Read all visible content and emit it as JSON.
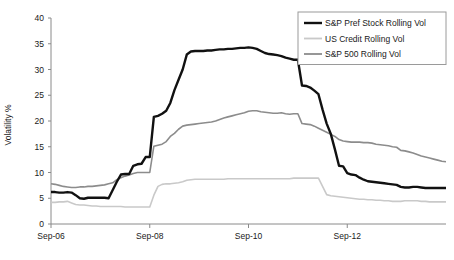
{
  "chart_data": {
    "type": "line",
    "title": "",
    "subtitle": "",
    "xlabel": "",
    "ylabel": "Volatility %",
    "ylim": [
      0,
      40
    ],
    "yticks": [
      0,
      5,
      10,
      15,
      20,
      25,
      30,
      35,
      40
    ],
    "ytick_labels": [
      "0",
      "5",
      "10",
      "15",
      "20",
      "25",
      "30",
      "35",
      "40"
    ],
    "xtick_labels": [
      "Sep-06",
      "Sep-08",
      "Sep-10",
      "Sep-12"
    ],
    "xtick_positions": [
      0,
      24,
      48,
      72
    ],
    "xlim": [
      0,
      96
    ],
    "x_unit": "months since Sep-06",
    "grid": false,
    "legend_position": "top-right",
    "colors": {
      "sp_pref_stock": "#111111",
      "us_credit": "#c9c9c9",
      "sp_500": "#8c8c8c",
      "axis": "#8a8a8a",
      "text": "#1a1a1a",
      "background": "#ffffff"
    },
    "series": [
      {
        "name": "S&P Pref Stock Rolling Vol",
        "color": "#111111",
        "width": 2.4,
        "x": [
          0,
          1,
          2,
          3,
          4,
          5,
          6,
          7,
          8,
          9,
          10,
          11,
          12,
          13,
          14,
          15,
          16,
          17,
          18,
          19,
          20,
          21,
          22,
          23,
          24,
          25,
          26,
          27,
          28,
          29,
          30,
          31,
          32,
          33,
          34,
          35,
          36,
          37,
          38,
          39,
          40,
          41,
          42,
          43,
          44,
          45,
          46,
          47,
          48,
          49,
          50,
          51,
          52,
          53,
          54,
          55,
          56,
          57,
          58,
          59,
          60,
          61,
          62,
          63,
          64,
          65,
          66,
          67,
          68,
          69,
          70,
          71,
          72,
          73,
          74,
          75,
          76,
          77,
          78,
          79,
          80,
          81,
          82,
          83,
          84,
          85,
          86,
          87,
          88,
          89,
          90,
          91,
          92,
          93,
          94,
          95,
          96
        ],
        "values": [
          6.2,
          6.2,
          6.1,
          6.1,
          6.2,
          6.1,
          5.6,
          5.0,
          4.9,
          5.1,
          5.1,
          5.1,
          5.1,
          5.1,
          5.0,
          6.6,
          8.2,
          9.6,
          9.7,
          9.7,
          11.3,
          11.6,
          11.7,
          13.0,
          13.0,
          20.8,
          21.0,
          21.4,
          22.0,
          23.5,
          26.0,
          28.0,
          30.0,
          32.9,
          33.5,
          33.6,
          33.6,
          33.6,
          33.7,
          33.7,
          33.8,
          33.9,
          33.9,
          34.0,
          34.0,
          34.1,
          34.2,
          34.2,
          34.3,
          34.2,
          34.0,
          33.6,
          33.2,
          33.0,
          32.9,
          32.8,
          32.6,
          32.3,
          32.1,
          31.9,
          31.9,
          26.9,
          26.8,
          26.5,
          25.9,
          25.2,
          22.2,
          19.5,
          17.5,
          14.5,
          11.3,
          11.2,
          9.9,
          9.6,
          9.5,
          9.0,
          8.6,
          8.3,
          8.2,
          8.1,
          8.0,
          7.9,
          7.8,
          7.7,
          7.6,
          7.2,
          7.1,
          7.1,
          7.2,
          7.2,
          7.1,
          7.0,
          7.0,
          7.0,
          7.0,
          7.0,
          7.0
        ]
      },
      {
        "name": "US Credit Rolling Vol",
        "color": "#c9c9c9",
        "width": 1.6,
        "x": [
          0,
          1,
          2,
          3,
          4,
          5,
          6,
          7,
          8,
          9,
          10,
          11,
          12,
          13,
          14,
          15,
          16,
          17,
          18,
          19,
          20,
          21,
          22,
          23,
          24,
          25,
          26,
          27,
          28,
          29,
          30,
          31,
          32,
          33,
          34,
          35,
          36,
          37,
          38,
          39,
          40,
          41,
          42,
          43,
          44,
          45,
          46,
          47,
          48,
          49,
          50,
          51,
          52,
          53,
          54,
          55,
          56,
          57,
          58,
          59,
          60,
          61,
          62,
          63,
          64,
          65,
          66,
          67,
          68,
          69,
          70,
          71,
          72,
          73,
          74,
          75,
          76,
          77,
          78,
          79,
          80,
          81,
          82,
          83,
          84,
          85,
          86,
          87,
          88,
          89,
          90,
          91,
          92,
          93,
          94,
          95,
          96
        ],
        "values": [
          4.2,
          4.2,
          4.3,
          4.3,
          4.4,
          4.1,
          3.8,
          3.7,
          3.7,
          3.6,
          3.5,
          3.5,
          3.4,
          3.4,
          3.4,
          3.4,
          3.4,
          3.4,
          3.3,
          3.3,
          3.3,
          3.3,
          3.3,
          3.3,
          3.3,
          5.6,
          7.3,
          7.7,
          7.8,
          7.8,
          7.9,
          8.0,
          8.2,
          8.5,
          8.6,
          8.7,
          8.7,
          8.7,
          8.7,
          8.7,
          8.7,
          8.7,
          8.7,
          8.8,
          8.8,
          8.8,
          8.8,
          8.8,
          8.8,
          8.8,
          8.8,
          8.8,
          8.8,
          8.8,
          8.8,
          8.8,
          8.8,
          8.8,
          8.8,
          8.9,
          8.9,
          8.9,
          8.9,
          8.9,
          8.9,
          8.9,
          7.3,
          5.7,
          5.5,
          5.4,
          5.3,
          5.2,
          5.1,
          5.0,
          4.9,
          4.8,
          4.8,
          4.7,
          4.7,
          4.6,
          4.6,
          4.5,
          4.5,
          4.4,
          4.4,
          4.4,
          4.5,
          4.5,
          4.5,
          4.5,
          4.4,
          4.4,
          4.3,
          4.3,
          4.3,
          4.3,
          4.3
        ]
      },
      {
        "name": "S&P 500 Rolling Vol",
        "color": "#8c8c8c",
        "width": 1.6,
        "x": [
          0,
          1,
          2,
          3,
          4,
          5,
          6,
          7,
          8,
          9,
          10,
          11,
          12,
          13,
          14,
          15,
          16,
          17,
          18,
          19,
          20,
          21,
          22,
          23,
          24,
          25,
          26,
          27,
          28,
          29,
          30,
          31,
          32,
          33,
          34,
          35,
          36,
          37,
          38,
          39,
          40,
          41,
          42,
          43,
          44,
          45,
          46,
          47,
          48,
          49,
          50,
          51,
          52,
          53,
          54,
          55,
          56,
          57,
          58,
          59,
          60,
          61,
          62,
          63,
          64,
          65,
          66,
          67,
          68,
          69,
          70,
          71,
          72,
          73,
          74,
          75,
          76,
          77,
          78,
          79,
          80,
          81,
          82,
          83,
          84,
          85,
          86,
          87,
          88,
          89,
          90,
          91,
          92,
          93,
          94,
          95,
          96
        ],
        "values": [
          7.8,
          7.7,
          7.5,
          7.3,
          7.2,
          7.1,
          7.1,
          7.2,
          7.2,
          7.3,
          7.3,
          7.4,
          7.5,
          7.6,
          7.8,
          8.0,
          8.6,
          9.0,
          9.3,
          9.5,
          9.8,
          10.0,
          10.0,
          10.0,
          10.0,
          15.1,
          15.3,
          15.5,
          16.0,
          17.0,
          17.6,
          18.4,
          19.0,
          19.2,
          19.3,
          19.4,
          19.5,
          19.6,
          19.7,
          19.8,
          20.0,
          20.3,
          20.6,
          20.8,
          21.0,
          21.2,
          21.4,
          21.6,
          21.9,
          22.0,
          22.0,
          21.8,
          21.7,
          21.6,
          21.5,
          21.5,
          21.6,
          21.4,
          21.3,
          21.4,
          21.4,
          19.5,
          19.4,
          19.3,
          19.0,
          18.6,
          18.2,
          17.8,
          17.4,
          17.0,
          16.4,
          16.1,
          16.0,
          15.9,
          15.9,
          15.9,
          15.8,
          15.8,
          15.7,
          15.5,
          15.4,
          15.3,
          15.2,
          15.0,
          14.9,
          14.3,
          14.2,
          14.0,
          13.8,
          13.5,
          13.2,
          13.0,
          12.8,
          12.6,
          12.4,
          12.2,
          12.1
        ]
      }
    ]
  },
  "axis": {
    "y_axis_title": "Volatility %"
  },
  "legend": {
    "items": [
      {
        "label": "S&P Pref Stock Rolling Vol",
        "color": "#111111",
        "width": 2.4
      },
      {
        "label": "US Credit Rolling Vol",
        "color": "#c9c9c9",
        "width": 1.8
      },
      {
        "label": "S&P 500 Rolling Vol",
        "color": "#8c8c8c",
        "width": 1.8
      }
    ]
  }
}
